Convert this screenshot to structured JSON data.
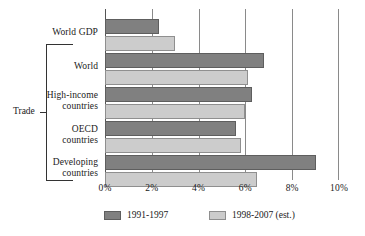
{
  "chart_data": {
    "type": "bar",
    "orientation": "horizontal",
    "title": "",
    "xlabel": "",
    "ylabel": "",
    "xlim": [
      0,
      10
    ],
    "xunit": "%",
    "grid": true,
    "legend_position": "bottom",
    "categories": [
      "World GDP",
      "World",
      "High-income\ncountries",
      "OECD\ncountries",
      "Developing\ncountries"
    ],
    "tick_labels": [
      "0%",
      "2%",
      "4%",
      "6%",
      "8%",
      "10%"
    ],
    "tick_values": [
      0,
      2,
      4,
      6,
      8,
      10
    ],
    "series": [
      {
        "name": "1991-1997",
        "color": "#808080",
        "values": [
          2.3,
          6.8,
          6.3,
          5.6,
          9.0
        ]
      },
      {
        "name": "1998-2007 (est.)",
        "color": "#cccccc",
        "values": [
          3.0,
          6.1,
          6.0,
          5.8,
          6.5
        ]
      }
    ],
    "group_bracket": {
      "label": "Trade",
      "covers": [
        "World",
        "High-income countries",
        "OECD countries",
        "Developing countries"
      ]
    }
  },
  "legend": {
    "items": [
      {
        "label": "1991-1997",
        "swatch": "series-1-swatch"
      },
      {
        "label": "1998-2007 (est.)",
        "swatch": "series-2-swatch"
      }
    ]
  }
}
